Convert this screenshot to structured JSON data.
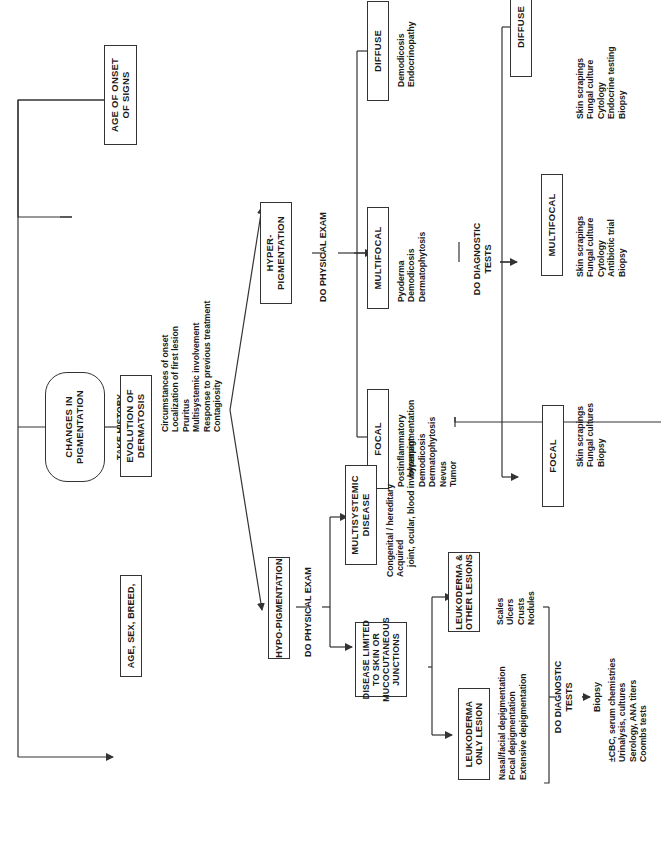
{
  "diagram": {
    "orientation": "rotated-90-ccw",
    "root": {
      "label": "CHANGES IN\nPIGMENTATION"
    },
    "take_history": {
      "label": "TAKE HISTORY",
      "boxes": [
        {
          "label": "AGE OF ONSET\nOF SIGNS"
        },
        {
          "label": "EVOLUTION OF\nDERMATOSIS"
        },
        {
          "label": "AGE, SEX, BREED,"
        }
      ],
      "evolution_items": [
        "Circumstances of onset",
        "Localization of first lesion",
        "Pruritus",
        "Multisystemic involvement",
        "Response to previous treatment",
        "Contagiosity"
      ]
    },
    "hyper": {
      "label": "HYPER-\nPIGMENTATION",
      "exam_label": "DO PHYSICAL EXAM",
      "branches": [
        {
          "label": "DIFFUSE",
          "items": [
            "Demodicosis",
            "Endocrinopathy"
          ]
        },
        {
          "label": "MULTIFOCAL",
          "items": [
            "Pyoderma",
            "Demodicosis",
            "Dermatophytosis"
          ]
        },
        {
          "label": "FOCAL",
          "items": [
            "Postinflammatory",
            "hyperpigmentation",
            "Demodicosis",
            "Dermatophytosis",
            "Nevus",
            "Tumor"
          ]
        }
      ],
      "tests_label": "DO DIAGNOSTIC\nTESTS",
      "test_branches": [
        {
          "label": "DIFFUSE",
          "items": [
            "Skin scrapings",
            "Fungal culture",
            "Cytology",
            "Endocrine testing",
            "Biopsy"
          ]
        },
        {
          "label": "MULTIFOCAL",
          "items": [
            "Skin scrapings",
            "Fungal culture",
            "Cytology",
            "Antibiotic trial",
            "Biopsy"
          ]
        },
        {
          "label": "FOCAL",
          "items": [
            "Skin scrapings",
            "Fungal cultures",
            "Biopsy"
          ]
        }
      ]
    },
    "hypo": {
      "label": "HYPO-PIGMENTATION",
      "exam_label": "DO PHYSICAL EXAM",
      "multisystemic": {
        "label": "MULTISYSTEMIC\nDISEASE",
        "items": [
          "Congenital /  hereditary",
          "Acquired",
          "joint, ocular, blood involvement"
        ]
      },
      "limited": {
        "label": "DISEASE LIMITED\nTO SKIN OR\nMUCOCUTANEOUS\nJUNCTIONS"
      },
      "leukoderma_other": {
        "label": "LEUKODERMA &\nOTHER LESIONS",
        "items": [
          "Scales",
          "Ulcers",
          "Crusts",
          "Nodules"
        ]
      },
      "leukoderma_only": {
        "label": "LEUKODERMA\nONLY LESION",
        "items": [
          "Nasal/facial depigmentation",
          "Focal depigmentation",
          "Extensive depigmentation"
        ]
      },
      "tests_label": "DO DIAGNOSTIC\nTESTS",
      "biopsy_label": "Biopsy",
      "tests_items": [
        "±CBC, serum chemistries",
        "Urinalysis, cultures",
        "Serology, ANA titers",
        "Coombs tests"
      ]
    },
    "colors": {
      "line": "#333333",
      "text": "#1a1a1a",
      "background": "#ffffff"
    }
  }
}
